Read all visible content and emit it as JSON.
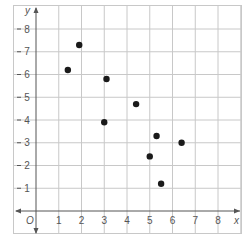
{
  "chart_data": {
    "type": "scatter",
    "title": "",
    "xlabel": "x",
    "ylabel": "y",
    "origin_label": "O",
    "xlim": [
      0,
      8
    ],
    "ylim": [
      0,
      8
    ],
    "grid": true,
    "x_ticks": [
      "1",
      "2",
      "3",
      "4",
      "5",
      "6",
      "7",
      "8"
    ],
    "y_ticks": [
      "1",
      "2",
      "3",
      "4",
      "5",
      "6",
      "7",
      "8"
    ],
    "points": [
      {
        "x": 1.4,
        "y": 6.2
      },
      {
        "x": 1.9,
        "y": 7.3
      },
      {
        "x": 3.1,
        "y": 5.8
      },
      {
        "x": 3.0,
        "y": 3.9
      },
      {
        "x": 4.4,
        "y": 4.7
      },
      {
        "x": 5.3,
        "y": 3.3
      },
      {
        "x": 6.4,
        "y": 3.0
      },
      {
        "x": 5.0,
        "y": 2.4
      },
      {
        "x": 5.5,
        "y": 1.2
      }
    ]
  },
  "colors": {
    "grid": "#c8c8c8",
    "axis": "#555555",
    "point": "#1a1a1a"
  }
}
